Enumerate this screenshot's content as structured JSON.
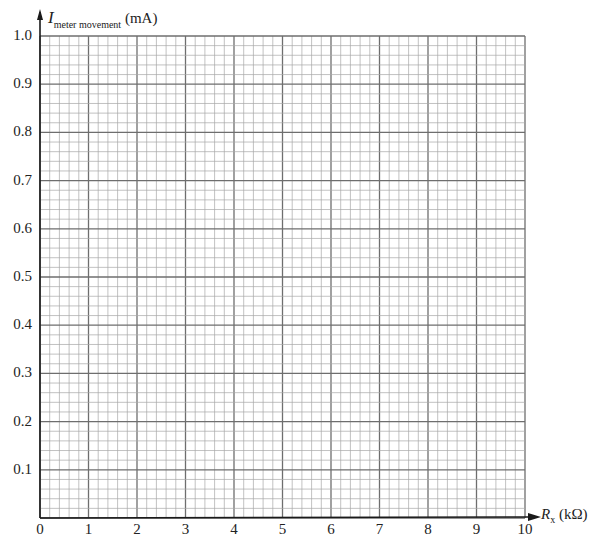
{
  "chart_data": {
    "type": "line",
    "title": "",
    "xlabel": "R_x (kΩ)",
    "ylabel": "I_meter movement (mA)",
    "xlabel_parts": {
      "symbol": "R",
      "sub": "x",
      "unit": "(kΩ)"
    },
    "ylabel_parts": {
      "symbol": "I",
      "sub": "meter movement",
      "unit": "(mA)"
    },
    "x_ticks": [
      "0",
      "1",
      "2",
      "3",
      "4",
      "5",
      "6",
      "7",
      "8",
      "9",
      "10"
    ],
    "y_ticks": [
      "0.1",
      "0.2",
      "0.3",
      "0.4",
      "0.5",
      "0.6",
      "0.7",
      "0.8",
      "0.9",
      "1.0"
    ],
    "xlim": [
      0,
      10
    ],
    "ylim": [
      0,
      1.0
    ],
    "grid": {
      "major_x": 1,
      "minor_x": 0.2,
      "major_y": 0.1,
      "minor_y": 0.02
    },
    "series": [],
    "legend": null,
    "colors": {
      "major_grid": "#6e6e6e",
      "minor_grid": "#a8a8a8",
      "axis": "#1a1a1a"
    }
  }
}
